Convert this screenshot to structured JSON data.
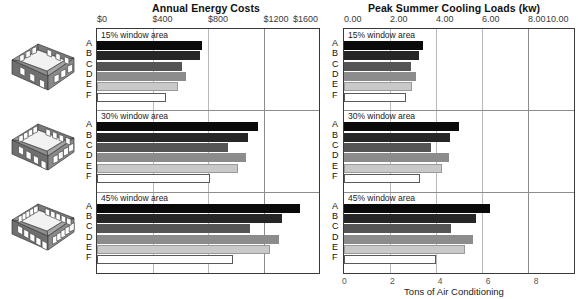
{
  "chart_data": [
    {
      "type": "bar",
      "title": "Annual Energy Costs",
      "xlabel": "",
      "ylabel": "",
      "xlim": [
        0,
        1600
      ],
      "xticks": [
        "$0",
        "$400",
        "$800",
        "$1200",
        "$1600"
      ],
      "xtick_values": [
        0,
        400,
        800,
        1200,
        1600
      ],
      "grid": true,
      "legend": "none",
      "orientation": "horizontal",
      "categories": [
        "A",
        "B",
        "C",
        "D",
        "E",
        "F"
      ],
      "groups": [
        {
          "label": "15% window area",
          "values": [
            760,
            745,
            610,
            645,
            585,
            500
          ]
        },
        {
          "label": "30% window area",
          "values": [
            1160,
            1090,
            945,
            1075,
            1015,
            815
          ]
        },
        {
          "label": "45% window area",
          "values": [
            1460,
            1335,
            1100,
            1315,
            1245,
            980
          ]
        }
      ]
    },
    {
      "type": "bar",
      "title": "Peak Summer Cooling Loads (kw)",
      "xlabel": "Tons of Air Conditioning",
      "ylabel": "",
      "xlim": [
        0,
        10
      ],
      "xticks": [
        "0.00",
        "2.00",
        "4.00",
        "6.00",
        "8.00",
        "10.00"
      ],
      "xtick_values": [
        0,
        2,
        4,
        6,
        8,
        10
      ],
      "xticks_bottom": [
        "0",
        "2",
        "4",
        "6",
        "8"
      ],
      "xtick_bottom_values": [
        0,
        2,
        4,
        6,
        8
      ],
      "grid": true,
      "legend": "none",
      "orientation": "horizontal",
      "categories": [
        "A",
        "B",
        "C",
        "D",
        "E",
        "F"
      ],
      "groups": [
        {
          "label": "15% window area",
          "values": [
            3.45,
            3.25,
            2.9,
            3.15,
            2.95,
            2.7
          ]
        },
        {
          "label": "30% window area",
          "values": [
            5.0,
            4.6,
            3.8,
            4.55,
            4.25,
            3.3
          ]
        },
        {
          "label": "45% window area",
          "values": [
            6.35,
            5.75,
            4.65,
            5.6,
            5.25,
            4.0
          ]
        }
      ]
    }
  ],
  "series_shades": [
    "#0a0a0a",
    "#262626",
    "#555555",
    "#8c8c8c",
    "#c9c9c9",
    "#ffffff"
  ],
  "icons": [
    {
      "name": "building-15-percent-windows",
      "windows_per_side": 2
    },
    {
      "name": "building-30-percent-windows",
      "windows_per_side": 3
    },
    {
      "name": "building-45-percent-windows",
      "windows_per_side": 4
    }
  ],
  "panels": {
    "left": {
      "title": "Annual Energy Costs"
    },
    "right": {
      "title": "Peak Summer Cooling Loads (kw)",
      "bottom_caption": "Tons of Air Conditioning"
    }
  }
}
